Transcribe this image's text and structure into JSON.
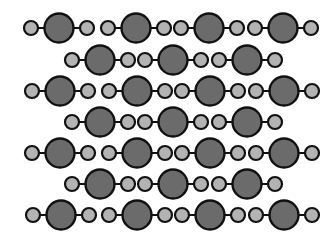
{
  "diagram": {
    "title": "",
    "colors": {
      "background": "#ffffff",
      "central_atom": "#6b6b6b",
      "outer_atom": "#b3b3b3",
      "outline": "#111111",
      "bond": "#111111"
    },
    "atom_radius": {
      "central": 14.5,
      "outer": 7
    },
    "bond_offset": 28,
    "rows": [
      {
        "y": 28,
        "centers": [
          59,
          136,
          209,
          283
        ]
      },
      {
        "y": 60,
        "centers": [
          100,
          173,
          247
        ]
      },
      {
        "y": 91,
        "centers": [
          60,
          137,
          210,
          284
        ]
      },
      {
        "y": 122,
        "centers": [
          100,
          173,
          247
        ]
      },
      {
        "y": 153,
        "centers": [
          60,
          137,
          210,
          284
        ]
      },
      {
        "y": 184,
        "centers": [
          100,
          173,
          247
        ]
      },
      {
        "y": 215,
        "centers": [
          61,
          137,
          210,
          284
        ]
      }
    ]
  }
}
